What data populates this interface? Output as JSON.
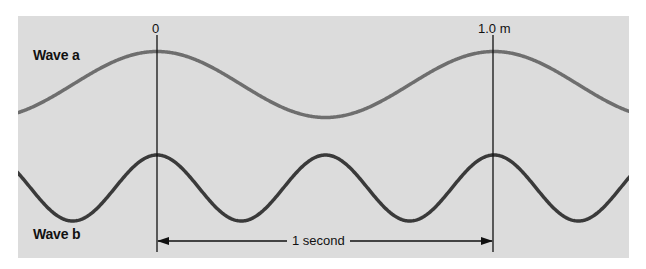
{
  "figure": {
    "background_color": "#dcdcdc",
    "wave_a": {
      "label": "Wave a",
      "color": "#6e6e6e",
      "wavelength_m": 1.0,
      "period_px": 337,
      "center_y": 84.5,
      "amplitude_px": 33,
      "peak_x": 157
    },
    "wave_b": {
      "label": "Wave b",
      "color": "#3a3a3a",
      "wavelength_m": 0.5,
      "period_px": 168.5,
      "center_y": 188,
      "amplitude_px": 33,
      "peak_x": 157
    },
    "markers": {
      "start_label": "0",
      "end_label": "1.0 m",
      "start_x": 157,
      "end_x": 493
    },
    "time_arrow": {
      "label": "1 second"
    }
  }
}
